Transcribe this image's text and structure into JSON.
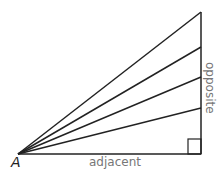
{
  "diagram": {
    "vertex_label": "A",
    "adjacent_label": "adjacent",
    "opposite_label": "opposite",
    "line_color": "#222222",
    "label_color": "#777777",
    "vertex": [
      18,
      154
    ],
    "right_angle_corner": [
      201,
      154
    ],
    "ray_endpoints_y": [
      12,
      47,
      77,
      108
    ]
  }
}
